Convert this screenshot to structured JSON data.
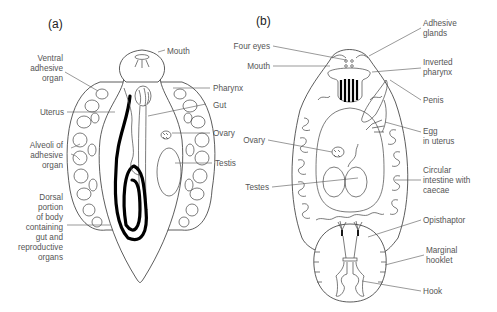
{
  "figure": {
    "panels": [
      {
        "id": "a",
        "label": "(a)",
        "annotations": [
          {
            "text": [
              "Mouth"
            ],
            "side": "right"
          },
          {
            "text": [
              "Ventral",
              "adhesive",
              "organ"
            ],
            "side": "left"
          },
          {
            "text": [
              "Pharynx"
            ],
            "side": "right"
          },
          {
            "text": [
              "Uterus"
            ],
            "side": "left"
          },
          {
            "text": [
              "Gut"
            ],
            "side": "right"
          },
          {
            "text": [
              "Ovary"
            ],
            "side": "right"
          },
          {
            "text": [
              "Alveoli of",
              "adhesive",
              "organ"
            ],
            "side": "left"
          },
          {
            "text": [
              "Testis"
            ],
            "side": "right"
          },
          {
            "text": [
              "Dorsal",
              "portion",
              "of body",
              "containing",
              "gut and",
              "reproductive",
              "organs"
            ],
            "side": "left"
          }
        ]
      },
      {
        "id": "b",
        "label": "(b)",
        "annotations": [
          {
            "text": [
              "Adhesive",
              "glands"
            ],
            "side": "right"
          },
          {
            "text": [
              "Four eyes"
            ],
            "side": "left"
          },
          {
            "text": [
              "Mouth"
            ],
            "side": "left"
          },
          {
            "text": [
              "Inverted",
              "pharynx"
            ],
            "side": "right"
          },
          {
            "text": [
              "Penis"
            ],
            "side": "right"
          },
          {
            "text": [
              "Egg",
              "in uterus"
            ],
            "side": "right"
          },
          {
            "text": [
              "Ovary"
            ],
            "side": "left"
          },
          {
            "text": [
              "Testes"
            ],
            "side": "left"
          },
          {
            "text": [
              "Circular",
              "intestine with",
              "caecae"
            ],
            "side": "right"
          },
          {
            "text": [
              "Opisthaptor"
            ],
            "side": "right"
          },
          {
            "text": [
              "Marginal",
              "hooklet"
            ],
            "side": "right"
          },
          {
            "text": [
              "Hook"
            ],
            "side": "right"
          }
        ]
      }
    ]
  },
  "colors": {
    "background": "#ffffff",
    "label_text": "#555555",
    "outline": "#333333",
    "uterus_fill": "#000000"
  }
}
